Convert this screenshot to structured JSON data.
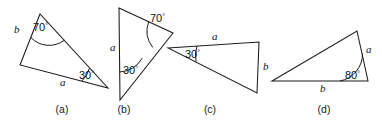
{
  "figure": {
    "width": 382,
    "height": 124,
    "background_color": "#ffffff",
    "stroke_color": "#1a1a1a"
  },
  "panels": [
    {
      "id": "a",
      "caption": "(a)",
      "caption_x": 62,
      "caption_y": 113,
      "angle": {
        "value": "70",
        "degree": "°",
        "label_x": 33,
        "label_y": 31
      },
      "sides": [
        {
          "name": "b",
          "label": "b",
          "x": 14,
          "y": 33
        },
        {
          "name": "a",
          "label": "a",
          "x": 60,
          "y": 86
        }
      ],
      "angle2": {
        "value": "30",
        "degree": "°",
        "label_x": 79,
        "label_y": 79
      },
      "vertices": [
        {
          "name": "apex",
          "x": 40,
          "y": 14
        },
        {
          "name": "left",
          "x": 20,
          "y": 65
        },
        {
          "name": "right",
          "x": 108,
          "y": 88
        }
      ]
    },
    {
      "id": "b",
      "caption": "(b)",
      "caption_x": 124,
      "caption_y": 113,
      "angle": {
        "value": "70",
        "degree": "°",
        "label_x": 150,
        "label_y": 22
      },
      "sides": [
        {
          "name": "a",
          "label": "a",
          "x": 110,
          "y": 51
        }
      ],
      "angle2": {
        "value": "30",
        "degree": "°",
        "label_x": 123,
        "label_y": 74
      },
      "vertices": [
        {
          "name": "top-left",
          "x": 119,
          "y": 8
        },
        {
          "name": "top-right",
          "x": 173,
          "y": 33
        },
        {
          "name": "bottom",
          "x": 120,
          "y": 100
        }
      ]
    },
    {
      "id": "c",
      "caption": "(c)",
      "caption_x": 210,
      "caption_y": 113,
      "angle": {
        "value": "30",
        "degree": "°",
        "label_x": 190,
        "label_y": 54
      },
      "sides": [
        {
          "name": "a",
          "label": "a",
          "x": 212,
          "y": 41
        },
        {
          "name": "b",
          "label": "b",
          "x": 262,
          "y": 69
        }
      ],
      "vertices": [
        {
          "name": "left",
          "x": 168,
          "y": 48
        },
        {
          "name": "top-right",
          "x": 259,
          "y": 42
        },
        {
          "name": "bottom-right",
          "x": 257,
          "y": 93
        }
      ]
    },
    {
      "id": "d",
      "caption": "(d)",
      "caption_x": 324,
      "caption_y": 113,
      "angle": {
        "value": "80",
        "degree": "°",
        "label_x": 353,
        "label_y": 75
      },
      "sides": [
        {
          "name": "a",
          "label": "a",
          "x": 366,
          "y": 52
        },
        {
          "name": "b",
          "label": "b",
          "x": 322,
          "y": 90
        }
      ],
      "vertices": [
        {
          "name": "left",
          "x": 272,
          "y": 81
        },
        {
          "name": "top",
          "x": 357,
          "y": 31
        },
        {
          "name": "right",
          "x": 368,
          "y": 81
        }
      ]
    }
  ]
}
